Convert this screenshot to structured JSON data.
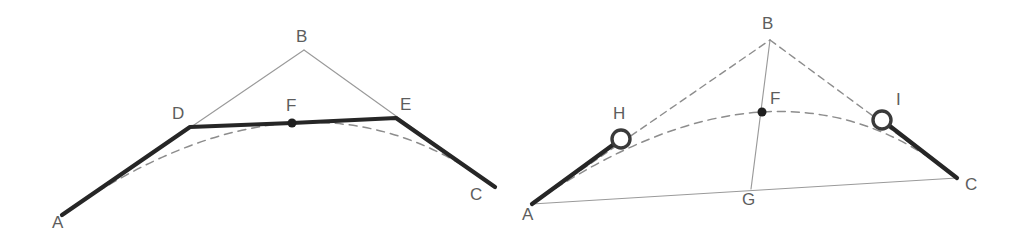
{
  "figure": {
    "background_color": "#ffffff",
    "colors": {
      "heavy_stroke": "#262626",
      "thin_stroke": "#9a9a9a",
      "dashed_stroke": "#8d8d8d",
      "label_text": "#5d5d5d",
      "dot_fill": "#1f1f1f",
      "circle_fill": "#ffffff",
      "circle_stroke": "#3a3a3a"
    },
    "panels": [
      {
        "id": "left-panel",
        "name": "chord-subdivision-diagram",
        "points": [
          {
            "id": "A",
            "label": "A",
            "x": 62,
            "y": 215,
            "label_x": 52,
            "label_y": 228,
            "marker": "none"
          },
          {
            "id": "D",
            "label": "D",
            "x": 190,
            "y": 127,
            "label_x": 172,
            "label_y": 119,
            "marker": "none"
          },
          {
            "id": "B",
            "label": "B",
            "x": 304,
            "y": 50,
            "label_x": 296,
            "label_y": 42,
            "marker": "none"
          },
          {
            "id": "F",
            "label": "F",
            "x": 292,
            "y": 123,
            "label_x": 286,
            "label_y": 111,
            "marker": "dot"
          },
          {
            "id": "E",
            "label": "E",
            "x": 396,
            "y": 118,
            "label_x": 400,
            "label_y": 110,
            "marker": "none"
          },
          {
            "id": "C",
            "label": "C",
            "x": 495,
            "y": 187,
            "label_x": 470,
            "label_y": 200,
            "marker": "none"
          }
        ],
        "thin_segments": [
          {
            "name": "segment-A-B",
            "from": "A",
            "to": "B"
          },
          {
            "name": "segment-B-C",
            "from": "B",
            "to": "C"
          }
        ],
        "heavy_polyline": {
          "name": "polyline-A-D-F-E-C",
          "vertices": [
            "A",
            "D",
            "F",
            "E",
            "C"
          ]
        },
        "dashed_curve": {
          "name": "parabolic-arc-A-F-C",
          "start": "A",
          "apex": "F",
          "end": "C"
        }
      },
      {
        "id": "right-panel",
        "name": "midpoint-construction-diagram",
        "points": [
          {
            "id": "A",
            "label": "A",
            "x": 532,
            "y": 204,
            "label_x": 522,
            "label_y": 220,
            "marker": "none"
          },
          {
            "id": "H",
            "label": "H",
            "x": 621,
            "y": 139,
            "label_x": 613,
            "label_y": 119,
            "marker": "circle"
          },
          {
            "id": "B",
            "label": "B",
            "x": 770,
            "y": 40,
            "label_x": 762,
            "label_y": 29,
            "marker": "none"
          },
          {
            "id": "F",
            "label": "F",
            "x": 762,
            "y": 112,
            "label_x": 770,
            "label_y": 104,
            "marker": "dot"
          },
          {
            "id": "I",
            "label": "I",
            "x": 882,
            "y": 120,
            "label_x": 896,
            "label_y": 105,
            "marker": "circle"
          },
          {
            "id": "G",
            "label": "G",
            "x": 751,
            "y": 189,
            "label_x": 742,
            "label_y": 205,
            "marker": "none"
          },
          {
            "id": "C",
            "label": "C",
            "x": 957,
            "y": 178,
            "label_x": 965,
            "label_y": 190,
            "marker": "none"
          }
        ],
        "thin_segments": [
          {
            "name": "segment-A-C",
            "from": "A",
            "to": "C"
          },
          {
            "name": "segment-B-G",
            "from": "B",
            "to": "G"
          }
        ],
        "dashed_segments": [
          {
            "name": "dashed-segment-A-B",
            "from": "A",
            "to": "B"
          },
          {
            "name": "dashed-segment-B-C",
            "from": "B",
            "to": "C"
          }
        ],
        "heavy_segments": [
          {
            "name": "heavy-segment-A-H",
            "from": "A",
            "to": "H"
          },
          {
            "name": "heavy-segment-I-C",
            "from": "I",
            "to": "C"
          }
        ],
        "dashed_curve": {
          "name": "parabolic-arc-A-F-C",
          "start": "A",
          "apex": "F",
          "end": "C"
        },
        "circle_radius": 9,
        "dot_radius": 4.5
      }
    ]
  }
}
